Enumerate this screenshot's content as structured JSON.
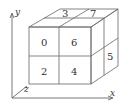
{
  "diagram": {
    "title": "",
    "axes": {
      "x": "x",
      "y": "y",
      "z": "z"
    },
    "front_labels": [
      "0",
      "6",
      "2",
      "4"
    ],
    "top_labels": [
      "3",
      "7"
    ],
    "right_labels": [
      "5"
    ]
  }
}
